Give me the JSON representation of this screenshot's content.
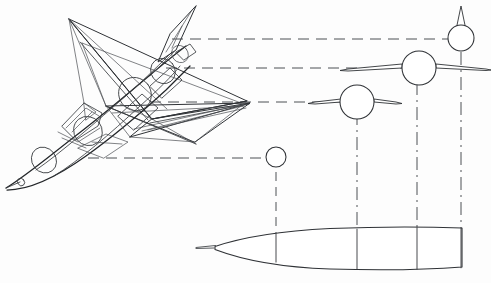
{
  "figure": {
    "type": "technical-line-drawing",
    "background_color": "#fdfdfd",
    "line_color": "#2f3236",
    "dash_color": "#4d5054",
    "canvas": {
      "width": 491,
      "height": 283
    }
  },
  "aircraft": {
    "name": "delta-wing-interceptor",
    "view": "three-quarter-perspective",
    "features": [
      "nose-pitot-boom",
      "cockpit-canopy",
      "delta-wing",
      "vertical-fin",
      "fuselage-cross-section-circles"
    ],
    "nose_tip": {
      "x": 6,
      "y": 188
    },
    "fin_tip": {
      "x": 196,
      "y": 6
    }
  },
  "projection_lines": {
    "name": "horizontal-projection-lines",
    "style": "dashed",
    "lines": [
      {
        "id": "proj-1",
        "y": 39,
        "x1": 172,
        "x2": 452
      },
      {
        "id": "proj-2",
        "y": 68,
        "x1": 166,
        "x2": 412
      },
      {
        "id": "proj-3",
        "y": 102,
        "x1": 150,
        "x2": 340
      },
      {
        "id": "proj-4",
        "y": 158,
        "x1": 88,
        "x2": 266
      }
    ]
  },
  "station_lines": {
    "name": "vertical-station-lines",
    "style": "dash-dot",
    "lines": [
      {
        "id": "stn-1",
        "x": 276,
        "y1": 172,
        "y2": 246
      },
      {
        "id": "stn-2",
        "x": 357,
        "y1": 112,
        "y2": 242
      },
      {
        "id": "stn-3",
        "x": 417,
        "y1": 82,
        "y2": 238
      },
      {
        "id": "stn-4",
        "x": 461,
        "y1": 52,
        "y2": 236
      }
    ]
  },
  "cross_sections": [
    {
      "id": "section-a",
      "label": "station-1-nose",
      "center": {
        "x": 276,
        "y": 157
      },
      "radius": 10,
      "has_wing": false,
      "has_fin": false
    },
    {
      "id": "section-b",
      "label": "station-2-forward-wing",
      "center": {
        "x": 357,
        "y": 102
      },
      "radius": 17,
      "has_wing": true,
      "wing_span": 32,
      "has_fin": false
    },
    {
      "id": "section-c",
      "label": "station-3-max-wing",
      "center": {
        "x": 419,
        "y": 68
      },
      "radius": 17,
      "has_wing": true,
      "wing_span": 72,
      "has_fin": false
    },
    {
      "id": "section-d",
      "label": "station-4-tail-fin",
      "center": {
        "x": 461,
        "y": 38
      },
      "radius": 13,
      "has_wing": false,
      "has_fin": true,
      "fin_height": 32
    }
  ],
  "fuselage_profile": {
    "name": "side-view-fuselage-outline",
    "nose_spike": {
      "x": 196,
      "y": 247
    },
    "nose_root": {
      "x": 215,
      "y": 246
    },
    "tail": {
      "x": 462,
      "y": 236
    },
    "rib_stations": [
      276,
      357,
      417,
      461
    ]
  }
}
